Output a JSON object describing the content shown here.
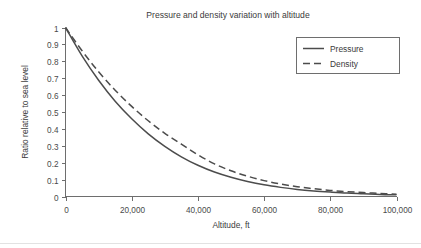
{
  "chart_data": {
    "type": "line",
    "title": "Pressure and density variation with altitude",
    "xlabel": "Altitude, ft",
    "ylabel": "Ratio relative to sea level",
    "xlim": [
      0,
      100000
    ],
    "ylim": [
      0,
      1
    ],
    "grid": false,
    "legend_position": "top-right",
    "x_ticks": [
      0,
      20000,
      40000,
      60000,
      80000,
      100000
    ],
    "x_tick_labels": [
      "0",
      "20,000",
      "40,000",
      "60,000",
      "80,000",
      "100,000"
    ],
    "y_ticks": [
      0,
      0.1,
      0.2,
      0.3,
      0.4,
      0.5,
      0.6,
      0.7,
      0.8,
      0.9,
      1
    ],
    "y_tick_labels": [
      "0",
      "0.1",
      "0.2",
      "0.3",
      "0.4",
      "0.5",
      "0.6",
      "0.7",
      "0.8",
      "0.9",
      "1"
    ],
    "x": [
      0,
      5000,
      10000,
      15000,
      20000,
      25000,
      30000,
      35000,
      40000,
      45000,
      50000,
      55000,
      60000,
      65000,
      70000,
      75000,
      80000,
      85000,
      90000,
      95000,
      100000
    ],
    "series": [
      {
        "name": "Pressure",
        "line_style": "solid",
        "color": "#4c4c4c",
        "values": [
          1.0,
          0.832,
          0.688,
          0.564,
          0.46,
          0.371,
          0.297,
          0.235,
          0.185,
          0.145,
          0.114,
          0.089,
          0.069,
          0.054,
          0.042,
          0.033,
          0.026,
          0.02,
          0.016,
          0.012,
          0.01
        ]
      },
      {
        "name": "Density",
        "line_style": "dashed",
        "color": "#4c4c4c",
        "values": [
          1.0,
          0.862,
          0.738,
          0.629,
          0.533,
          0.448,
          0.374,
          0.31,
          0.247,
          0.193,
          0.152,
          0.12,
          0.094,
          0.074,
          0.058,
          0.046,
          0.036,
          0.029,
          0.023,
          0.018,
          0.014
        ]
      }
    ]
  },
  "legend": {
    "items": [
      {
        "label": "Pressure"
      },
      {
        "label": "Density"
      }
    ]
  }
}
